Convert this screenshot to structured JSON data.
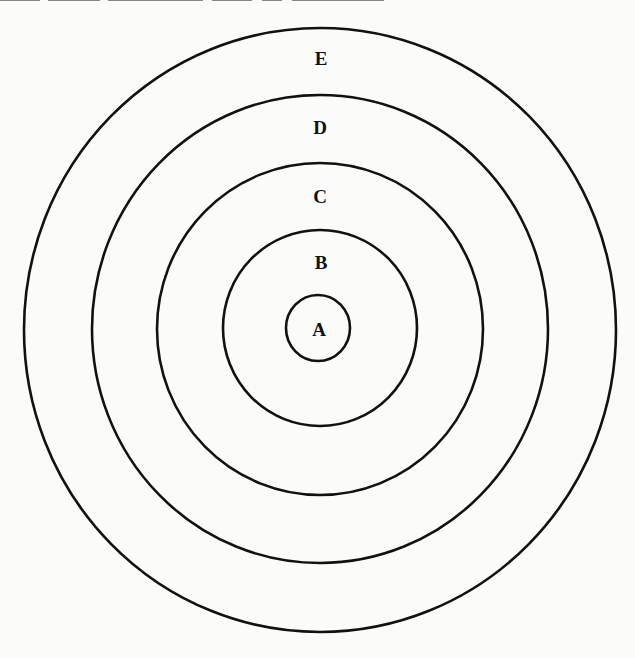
{
  "diagram": {
    "type": "concentric-circles",
    "header_clipped": true,
    "rings": [
      {
        "id": "A",
        "label": "A",
        "cx": 318,
        "cy": 328,
        "rx": 32,
        "ry": 33
      },
      {
        "id": "B",
        "label": "B",
        "cx": 320,
        "cy": 328,
        "rx": 97,
        "ry": 98
      },
      {
        "id": "C",
        "label": "C",
        "cx": 320,
        "cy": 329,
        "rx": 163,
        "ry": 166
      },
      {
        "id": "D",
        "label": "D",
        "cx": 320,
        "cy": 329,
        "rx": 228,
        "ry": 234
      },
      {
        "id": "E",
        "label": "E",
        "cx": 320,
        "cy": 330,
        "rx": 296,
        "ry": 302
      }
    ],
    "label_positions": {
      "A": {
        "x": 319,
        "y": 328
      },
      "B": {
        "x": 321,
        "y": 261
      },
      "C": {
        "x": 320,
        "y": 195
      },
      "D": {
        "x": 320,
        "y": 126
      },
      "E": {
        "x": 321,
        "y": 58
      }
    },
    "labels": {
      "A": "A",
      "B": "B",
      "C": "C",
      "D": "D",
      "E": "E"
    }
  }
}
